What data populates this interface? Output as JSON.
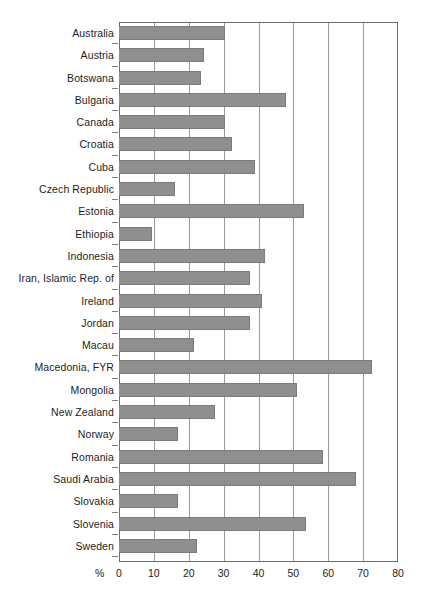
{
  "chart_data": {
    "type": "bar",
    "orientation": "horizontal",
    "title": "",
    "xlabel": "%",
    "ylabel": "",
    "xlim": [
      0,
      80
    ],
    "xticks": [
      0,
      10,
      20,
      30,
      40,
      50,
      60,
      70,
      80
    ],
    "grid": true,
    "legend": false,
    "bar_color": "#8f8f8f",
    "categories": [
      "Australia",
      "Austria",
      "Botswana",
      "Bulgaria",
      "Canada",
      "Croatia",
      "Cuba",
      "Czech Republic",
      "Estonia",
      "Ethiopia",
      "Indonesia",
      "Iran, Islamic Rep. of",
      "Ireland",
      "Jordan",
      "Macau",
      "Macedonia, FYR",
      "Mongolia",
      "New Zealand",
      "Norway",
      "Romania",
      "Saudi Arabia",
      "Slovakia",
      "Slovenia",
      "Sweden"
    ],
    "values": [
      30.5,
      24.5,
      23.5,
      48.0,
      30.5,
      32.5,
      39.0,
      16.0,
      53.0,
      9.5,
      42.0,
      37.5,
      41.0,
      37.5,
      21.5,
      72.5,
      51.0,
      27.5,
      17.0,
      58.5,
      68.0,
      17.0,
      53.5,
      22.5
    ]
  },
  "axis": {
    "unit_label": "%",
    "tick_labels": [
      "0",
      "10",
      "20",
      "30",
      "40",
      "50",
      "60",
      "70",
      "80"
    ]
  },
  "top_artifact": {
    "text": ""
  }
}
